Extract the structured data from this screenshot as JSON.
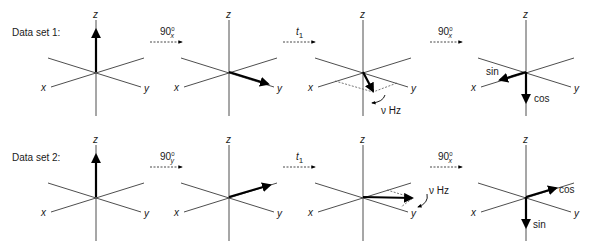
{
  "rows": [
    {
      "label": "Data set 1:",
      "steps": [
        {
          "op_main": "90",
          "op_sup": "0",
          "op_sub": "x"
        },
        {
          "op_main": "t",
          "op_sub": "1"
        },
        {
          "op_main": "90",
          "op_sup": "0",
          "op_sub": "x"
        }
      ],
      "panels": [
        {
          "vector": "+z"
        },
        {
          "vector": "+y"
        },
        {
          "vector": "xy-plane",
          "annotation": "ν Hz"
        },
        {
          "vector_labels": [
            "sin",
            "cos"
          ]
        }
      ]
    },
    {
      "label": "Data set 2:",
      "steps": [
        {
          "op_main": "90",
          "op_sup": "0",
          "op_sub": "y"
        },
        {
          "op_main": "t",
          "op_sub": "1"
        },
        {
          "op_main": "90",
          "op_sup": "0",
          "op_sub": "x"
        }
      ],
      "panels": [
        {
          "vector": "+z"
        },
        {
          "vector": "-x"
        },
        {
          "vector": "xy-plane",
          "annotation": "ν Hz"
        },
        {
          "vector_labels": [
            "cos",
            "sin"
          ]
        }
      ]
    }
  ],
  "axis_labels": {
    "x": "x",
    "y": "y",
    "z": "z"
  },
  "annotation_hz": "ν Hz",
  "colors": {
    "axis": "#3a3a3a",
    "vector": "#000000",
    "dashed": "#555555"
  }
}
